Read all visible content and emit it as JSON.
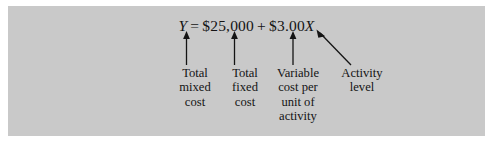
{
  "figure": {
    "background_color": "#c9c9c9",
    "text_color": "#141414",
    "equation": {
      "lhs": "Y",
      "equals": "=",
      "fixed_term": "$25,000",
      "plus": "+",
      "rate": "$3.00",
      "rate_variable": "X",
      "full_text": "Y = $25,000 + $3.00X"
    },
    "callouts": [
      {
        "id": "total-mixed-cost",
        "lines": [
          "Total",
          "mixed",
          "cost"
        ],
        "points_to": "Y",
        "arrow": "vertical-up"
      },
      {
        "id": "total-fixed-cost",
        "lines": [
          "Total",
          "fixed",
          "cost"
        ],
        "points_to": "$25,000",
        "arrow": "vertical-up"
      },
      {
        "id": "variable-cost-per-unit",
        "lines": [
          "Variable",
          "cost per",
          "unit of",
          "activity"
        ],
        "points_to": "$3.00",
        "arrow": "vertical-up"
      },
      {
        "id": "activity-level",
        "lines": [
          "Activity",
          "level"
        ],
        "points_to": "X",
        "arrow": "diagonal-up-left"
      }
    ]
  }
}
